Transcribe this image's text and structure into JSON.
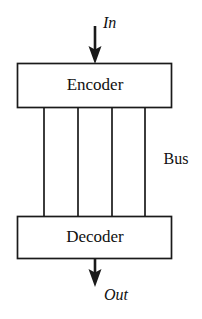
{
  "diagram": {
    "colors": {
      "stroke": "#1a1a1a",
      "text": "#111111",
      "background": "#ffffff"
    },
    "blocks": [
      {
        "id": "encoder",
        "label": "Encoder",
        "x": 17,
        "y": 63,
        "width": 155,
        "height": 45
      },
      {
        "id": "decoder",
        "label": "Decoder",
        "x": 17,
        "y": 216,
        "width": 155,
        "height": 43
      }
    ],
    "bus": {
      "label": "Bus",
      "label_x": 176,
      "label_y": 160,
      "line_count": 4,
      "lines_x": [
        44,
        78,
        112,
        145
      ],
      "y_top": 108,
      "y_bottom": 216
    },
    "arrows": [
      {
        "id": "in-arrow",
        "label": "In",
        "label_x": 103,
        "label_y": 24,
        "x": 95,
        "y_start": 26,
        "y_end": 63
      },
      {
        "id": "out-arrow",
        "label": "Out",
        "label_x": 104,
        "label_y": 296,
        "x": 95,
        "y_start": 259,
        "y_end": 286
      }
    ]
  }
}
